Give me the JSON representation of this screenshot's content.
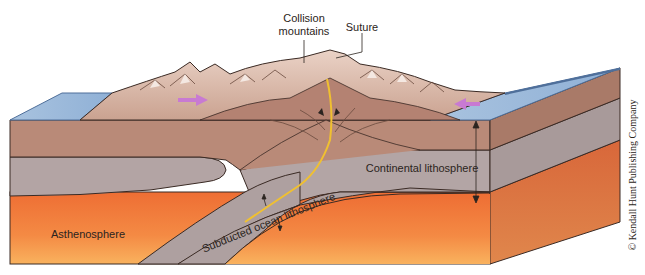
{
  "diagram": {
    "labels": {
      "collision_mountains_line1": "Collision",
      "collision_mountains_line2": "mountains",
      "suture": "Suture",
      "continental_lithosphere": "Continental lithosphere",
      "subducted_ocean_lithosphere": "Subducted ocean lithosphere",
      "asthenosphere": "Asthenosphere"
    },
    "credit": "© Kendall Hunt Publishing Company",
    "icons": {
      "left_plate_motion": "arrow-right-icon",
      "right_plate_motion": "arrow-left-icon",
      "compression_arrows": "converging-arrows-icon",
      "thickness_arrows": "double-headed-arrow-icon"
    },
    "colors": {
      "ocean": "#9bb9d9",
      "ocean_edge": "#4f6f9a",
      "crust": "#b98a78",
      "crust_side": "#a47464",
      "lithosphere_mantle": "#b0a2a2",
      "lithosphere_side": "#a39696",
      "asthenosphere_top": "#f07a3c",
      "asthenosphere_bottom": "#f8a85a",
      "mountains": "#dcbcae",
      "mountains_shadow": "#b08676",
      "suture_line": "#f0c030",
      "motion_arrow": "#c87ad2",
      "outline": "#3a2a24"
    }
  }
}
